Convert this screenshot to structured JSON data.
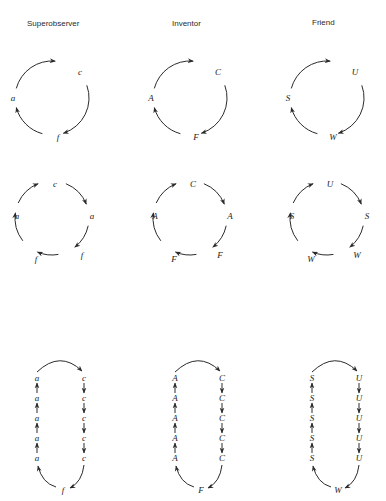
{
  "figure": {
    "columns": [
      {
        "header": "Superobserver",
        "cycle3": [
          "c",
          "f",
          "a"
        ],
        "cycle6": [
          "c",
          "a",
          "f",
          "f",
          "a"
        ],
        "loop": {
          "right": [
            "c",
            "c",
            "c",
            "c",
            "c"
          ],
          "bottom": "f",
          "left": [
            "a",
            "a",
            "a",
            "a",
            "a"
          ]
        }
      },
      {
        "header": "Inventor",
        "cycle3": [
          "C",
          "F",
          "A"
        ],
        "cycle6": [
          "C",
          "A",
          "F",
          "F",
          "A"
        ],
        "loop": {
          "right": [
            "C",
            "C",
            "C",
            "C",
            "C"
          ],
          "bottom": "F",
          "left": [
            "A",
            "A",
            "A",
            "A",
            "A"
          ]
        }
      },
      {
        "header": "Friend",
        "cycle3": [
          "U",
          "W",
          "S"
        ],
        "cycle6": [
          "U",
          "S",
          "W",
          "W",
          "S"
        ],
        "loop": {
          "right": [
            "U",
            "U",
            "U",
            "U",
            "U"
          ],
          "bottom": "W",
          "left": [
            "S",
            "S",
            "S",
            "S",
            "S"
          ]
        }
      }
    ]
  }
}
